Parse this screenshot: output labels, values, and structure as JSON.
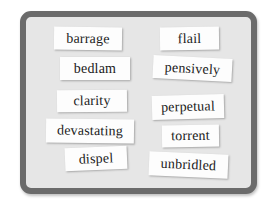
{
  "board": {
    "colors": {
      "frame": "#6b6b6b",
      "surface": "#e6e6e6",
      "card": "#fdfdfd",
      "text": "#1a1a1a"
    },
    "left_column": [
      {
        "word": "barrage"
      },
      {
        "word": "bedlam"
      },
      {
        "word": "clarity"
      },
      {
        "word": "devastating"
      },
      {
        "word": "dispel"
      }
    ],
    "right_column": [
      {
        "word": "flail"
      },
      {
        "word": "pensively"
      },
      {
        "word": "perpetual"
      },
      {
        "word": "torrent"
      },
      {
        "word": "unbridled"
      }
    ]
  }
}
